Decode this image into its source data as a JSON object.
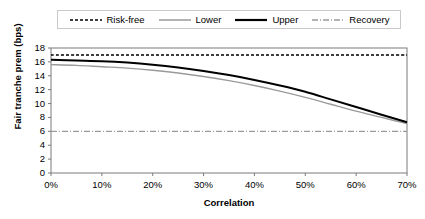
{
  "chart_data": {
    "type": "line",
    "title": "",
    "xlabel": "Correlation",
    "ylabel": "Fair tranche prem (bps)",
    "xlim": [
      0,
      70
    ],
    "ylim": [
      0,
      18
    ],
    "xticks": [
      "0%",
      "10%",
      "20%",
      "30%",
      "40%",
      "50%",
      "60%",
      "70%"
    ],
    "xtick_values": [
      0,
      10,
      20,
      30,
      40,
      50,
      60,
      70
    ],
    "yticks": [
      "0",
      "2",
      "4",
      "6",
      "8",
      "10",
      "12",
      "14",
      "16",
      "18"
    ],
    "ytick_values": [
      0,
      2,
      4,
      6,
      8,
      10,
      12,
      14,
      16,
      18
    ],
    "grid": false,
    "legend_position": "top",
    "x": [
      0,
      5,
      10,
      15,
      20,
      25,
      30,
      35,
      40,
      45,
      50,
      55,
      60,
      65,
      70
    ],
    "series": [
      {
        "name": "Risk-free",
        "style": "dotted",
        "color": "#000000",
        "width": 1.4,
        "values": [
          17.0,
          17.0,
          17.0,
          17.0,
          17.0,
          17.0,
          17.0,
          17.0,
          17.0,
          17.0,
          17.0,
          17.0,
          17.0,
          17.0,
          17.0
        ]
      },
      {
        "name": "Lower",
        "style": "solid",
        "color": "#9a9a9a",
        "width": 1.4,
        "values": [
          15.6,
          15.5,
          15.3,
          15.1,
          14.8,
          14.4,
          13.9,
          13.3,
          12.6,
          11.8,
          10.9,
          9.9,
          8.9,
          8.0,
          7.1
        ]
      },
      {
        "name": "Upper",
        "style": "solid",
        "color": "#000000",
        "width": 2.0,
        "values": [
          16.3,
          16.2,
          16.1,
          15.9,
          15.6,
          15.2,
          14.7,
          14.1,
          13.4,
          12.6,
          11.7,
          10.6,
          9.5,
          8.4,
          7.3
        ]
      },
      {
        "name": "Recovery",
        "style": "dashdot",
        "color": "#9a9a9a",
        "width": 1.2,
        "values": [
          6.0,
          6.0,
          6.0,
          6.0,
          6.0,
          6.0,
          6.0,
          6.0,
          6.0,
          6.0,
          6.0,
          6.0,
          6.0,
          6.0,
          6.0
        ]
      }
    ]
  },
  "legend": {
    "items": [
      {
        "label": "Risk-free"
      },
      {
        "label": "Lower"
      },
      {
        "label": "Upper"
      },
      {
        "label": "Recovery"
      }
    ]
  },
  "axes": {
    "frame_color": "#7a7a7a"
  }
}
